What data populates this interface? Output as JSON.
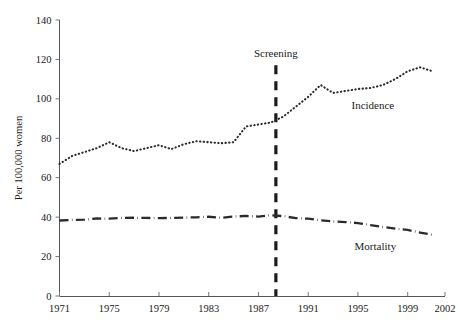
{
  "chart_data": {
    "type": "line",
    "title": "",
    "subtitle": "",
    "xlabel": "",
    "ylabel": "Per 100,000 women",
    "xlim": [
      1971,
      2002
    ],
    "ylim": [
      0,
      140
    ],
    "grid": false,
    "legend_position": "inline-labels",
    "x_ticks": [
      1971,
      1975,
      1979,
      1983,
      1987,
      1991,
      1995,
      1999,
      2002
    ],
    "x_tick_labels": [
      "1971",
      "1975",
      "1979",
      "1983",
      "1987",
      "1991",
      "1995",
      "1999",
      "2002"
    ],
    "y_ticks": [
      0,
      20,
      40,
      60,
      80,
      100,
      120,
      140
    ],
    "y_tick_labels": [
      "0",
      "20",
      "40",
      "60",
      "80",
      "100",
      "120",
      "140"
    ],
    "x": [
      1971,
      1972,
      1973,
      1974,
      1975,
      1976,
      1977,
      1978,
      1979,
      1980,
      1981,
      1982,
      1983,
      1984,
      1985,
      1986,
      1987,
      1988,
      1989,
      1990,
      1991,
      1992,
      1993,
      1994,
      1995,
      1996,
      1997,
      1998,
      1999,
      2000,
      2001
    ],
    "series": [
      {
        "name": "Incidence",
        "style": "dotted",
        "color": "#2b2b2b",
        "values": [
          67,
          71,
          73,
          75,
          78,
          75,
          73.5,
          75,
          76.5,
          74.5,
          77,
          78.5,
          78,
          77.5,
          78,
          86,
          87,
          88,
          91,
          96,
          101,
          107,
          103,
          104,
          105,
          105.5,
          107,
          110,
          114,
          116,
          114
        ]
      },
      {
        "name": "Mortality",
        "style": "dash-dot",
        "color": "#2b2b2b",
        "values": [
          38.3,
          38.6,
          38.7,
          39.3,
          39.2,
          39.6,
          39.7,
          39.6,
          39.5,
          39.6,
          39.8,
          39.9,
          40.2,
          39.7,
          40.3,
          40.6,
          40.3,
          41.0,
          40.5,
          39.5,
          39.2,
          38.4,
          37.8,
          37.5,
          37.0,
          36.0,
          35.0,
          34.2,
          33.5,
          32.2,
          31.0
        ]
      }
    ],
    "annotations": [
      {
        "name": "screening-marker",
        "label": "Screening",
        "x": 1988.4,
        "type": "vertical-dashed-line",
        "label_y": 121
      },
      {
        "name": "incidence-series-label",
        "label": "Incidence",
        "x": 1996.2,
        "y": 95,
        "type": "series-label"
      },
      {
        "name": "mortality-series-label",
        "label": "Mortality",
        "x": 1996.4,
        "y": 23.5,
        "type": "series-label"
      }
    ]
  },
  "axis": {
    "y_title": "Per 100,000 women"
  },
  "labels": {
    "screening": "Screening",
    "incidence": "Incidence",
    "mortality": "Mortality"
  }
}
